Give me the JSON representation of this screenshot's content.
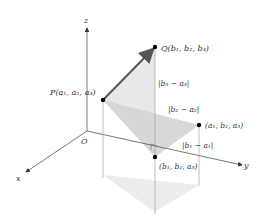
{
  "axes": {
    "z_label": "z",
    "x_label": "x",
    "y_label": "y",
    "origin_label": "O"
  },
  "points": {
    "P": {
      "label": "P(a₁, a₂, a₃)",
      "x": 103,
      "y": 100
    },
    "Q": {
      "label": "Q(b₁, b₂, b₃)",
      "x": 155,
      "y": 47
    },
    "R": {
      "label": "(a₁, b₂, a₃)",
      "x": 199,
      "y": 125
    },
    "S": {
      "label": "(b₁, b₂, a₃)",
      "x": 155,
      "y": 157
    }
  },
  "distances": {
    "dz": "|b₃ − a₃|",
    "dy": "|b₂ − a₂|",
    "dx": "|b₁ − a₁|"
  },
  "colors": {
    "axis": "#555555",
    "vector": "#555555",
    "shade_light": "#e6e6e6",
    "shade_mid": "#cfcfcf",
    "text": "#333333"
  }
}
